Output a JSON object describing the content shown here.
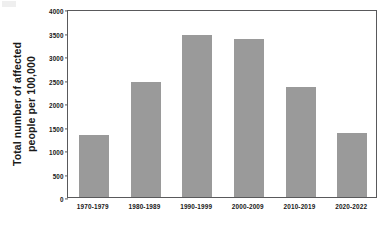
{
  "chart_data": {
    "type": "bar",
    "title": "",
    "subtitle": "",
    "xlabel": "",
    "ylabel": "Total number of affected people  per 100,000",
    "ylabel_lines": [
      "Total number of affected",
      "people  per 100,000"
    ],
    "categories": [
      "1970-1979",
      "1980-1989",
      "1990-1999",
      "2000-2009",
      "2010-2019",
      "2020-2022"
    ],
    "values": [
      1320,
      2450,
      3450,
      3370,
      2340,
      1370
    ],
    "ylim": [
      0,
      4000
    ],
    "ytick_labels": [
      "0",
      "500",
      "1000",
      "1500",
      "2000",
      "2500",
      "3000",
      "3500",
      "4000"
    ],
    "ytick_values": [
      0,
      500,
      1000,
      1500,
      2000,
      2500,
      3000,
      3500,
      4000
    ],
    "grid": false,
    "legend": false,
    "legend_position": "none",
    "bar_color": "#9a9a9a",
    "axis_color": "#59595b",
    "text_color": "#171717",
    "background_color": "#ffffff"
  }
}
